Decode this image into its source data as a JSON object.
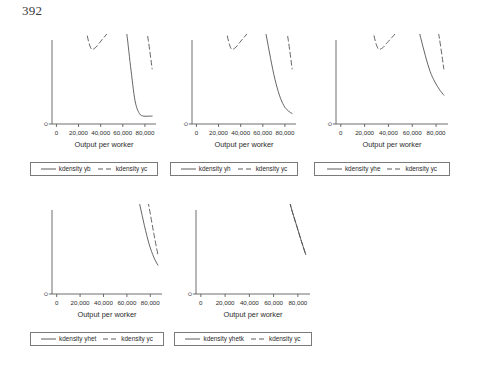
{
  "page": {
    "number": "392"
  },
  "chart_data": [
    {
      "id": "panel-yb",
      "type": "line",
      "title": "",
      "xlabel": "Output per worker",
      "ylabel": "",
      "xlim": [
        -4000,
        90000
      ],
      "ylim": [
        0,
        3.2e-06
      ],
      "xticks": [
        0,
        20000,
        40000,
        60000,
        80000
      ],
      "xticklabels": [
        "0",
        "20,000",
        "40,000",
        "60,000",
        "80,000"
      ],
      "yticks": [
        0,
        1e-05,
        2e-05,
        3e-05
      ],
      "yticklabels": [
        "0",
        ".00001",
        ".00002",
        ".00003"
      ],
      "grid": false,
      "legend_position": "bottom",
      "series": [
        {
          "name": "kdensity yb",
          "style": "solid",
          "x": [
            -1500,
            1500,
            4000,
            6500,
            9000,
            12000,
            15000,
            18000,
            21000,
            24000,
            27000,
            31000,
            35000,
            39000,
            43000,
            47000,
            51000,
            55000,
            59000,
            63000,
            67000,
            71000,
            75000,
            79000,
            83000,
            86500
          ],
          "y": [
            2.72e-05,
            3e-05,
            3.07e-05,
            3e-05,
            2.76e-05,
            2.24e-05,
            1.66e-05,
            1.14e-05,
            7.2e-06,
            5e-06,
            4.5e-06,
            4.7e-06,
            5.2e-06,
            5.6e-06,
            5.5e-06,
            5e-06,
            4.6e-06,
            4.4e-06,
            4.2e-06,
            3.6e-06,
            2.2e-06,
            9e-07,
            4e-07,
            3e-07,
            3e-07,
            3e-07
          ]
        },
        {
          "name": "kdensity yc",
          "style": "dashed",
          "x": [
            -1500,
            1500,
            4000,
            6500,
            9000,
            12000,
            15000,
            18000,
            21000,
            24000,
            27000,
            31000,
            35000,
            39000,
            43000,
            47000,
            51000,
            55000,
            59000,
            63000,
            67000,
            71000,
            75000,
            79000,
            83000,
            86500
          ],
          "y": [
            1.9e-05,
            2.07e-05,
            2.12e-05,
            2.07e-05,
            1.94e-05,
            1.68e-05,
            1.36e-05,
            1.02e-05,
            7.2e-06,
            5e-06,
            3.6e-06,
            2.9e-06,
            2.9e-06,
            3.1e-06,
            3.3e-06,
            3.5e-06,
            3.7e-06,
            3.9e-06,
            4.2e-06,
            4.4e-06,
            4.6e-06,
            4.7e-06,
            4.6e-06,
            4.2e-06,
            3.2e-06,
            2.1e-06
          ]
        }
      ]
    },
    {
      "id": "panel-yh",
      "type": "line",
      "title": "",
      "xlabel": "Output per worker",
      "ylabel": "",
      "xlim": [
        -4000,
        90000
      ],
      "ylim": [
        0,
        3.2e-06
      ],
      "xticks": [
        0,
        20000,
        40000,
        60000,
        80000
      ],
      "xticklabels": [
        "0",
        "20,000",
        "40,000",
        "60,000",
        "80,000"
      ],
      "yticks": [
        0,
        1e-05,
        2e-05,
        3e-05
      ],
      "yticklabels": [
        "0",
        ".00001",
        ".00002",
        ".00003"
      ],
      "grid": false,
      "legend_position": "bottom",
      "series": [
        {
          "name": "kdensity yh",
          "style": "solid",
          "x": [
            -1500,
            1500,
            4000,
            6500,
            9000,
            12000,
            15000,
            18000,
            21000,
            24000,
            27000,
            31000,
            35000,
            39000,
            43000,
            47000,
            51000,
            55000,
            59000,
            63000,
            67000,
            71000,
            75000,
            79000,
            83000,
            86500
          ],
          "y": [
            2.5e-05,
            2.8e-05,
            2.88e-05,
            2.82e-05,
            2.62e-05,
            2.16e-05,
            1.62e-05,
            1.12e-05,
            7.3e-06,
            5.2e-06,
            4.6e-06,
            4.6e-06,
            4.8e-06,
            5e-06,
            5e-06,
            4.9e-06,
            4.8e-06,
            4.6e-06,
            4.2e-06,
            3.4e-06,
            2.5e-06,
            1.7e-06,
            1.1e-06,
            7e-07,
            5e-07,
            4e-07
          ]
        },
        {
          "name": "kdensity yc",
          "style": "dashed",
          "x": [
            -1500,
            1500,
            4000,
            6500,
            9000,
            12000,
            15000,
            18000,
            21000,
            24000,
            27000,
            31000,
            35000,
            39000,
            43000,
            47000,
            51000,
            55000,
            59000,
            63000,
            67000,
            71000,
            75000,
            79000,
            83000,
            86500
          ],
          "y": [
            1.9e-05,
            2.07e-05,
            2.12e-05,
            2.07e-05,
            1.94e-05,
            1.68e-05,
            1.36e-05,
            1.02e-05,
            7.2e-06,
            5e-06,
            3.6e-06,
            2.9e-06,
            2.9e-06,
            3.1e-06,
            3.3e-06,
            3.5e-06,
            3.7e-06,
            3.9e-06,
            4.2e-06,
            4.4e-06,
            4.6e-06,
            4.7e-06,
            4.6e-06,
            4.2e-06,
            3.2e-06,
            2.1e-06
          ]
        }
      ]
    },
    {
      "id": "panel-yhe",
      "type": "line",
      "title": "",
      "xlabel": "Output per worker",
      "ylabel": "",
      "xlim": [
        -4000,
        90000
      ],
      "ylim": [
        0,
        3.2e-06
      ],
      "xticks": [
        0,
        20000,
        40000,
        60000,
        80000
      ],
      "xticklabels": [
        "0",
        "20,000",
        "40,000",
        "60,000",
        "80,000"
      ],
      "yticks": [
        0,
        1e-05,
        2e-05,
        3e-05
      ],
      "yticklabels": [
        "0",
        ".00001",
        ".00002",
        ".00003"
      ],
      "grid": false,
      "legend_position": "bottom",
      "series": [
        {
          "name": "kdensity yhe",
          "style": "solid",
          "x": [
            -1500,
            1500,
            4000,
            6500,
            9000,
            12000,
            15000,
            18000,
            21000,
            24000,
            27000,
            31000,
            35000,
            39000,
            43000,
            47000,
            51000,
            55000,
            59000,
            63000,
            67000,
            71000,
            75000,
            79000,
            83000,
            86500
          ],
          "y": [
            2.62e-05,
            2.94e-05,
            3.02e-05,
            2.96e-05,
            2.74e-05,
            2.26e-05,
            1.68e-05,
            1.14e-05,
            7.4e-06,
            5.2e-06,
            4.7e-06,
            4.8e-06,
            4.9e-06,
            4.8e-06,
            4.5e-06,
            4.3e-06,
            4.3e-06,
            4.4e-06,
            4.4e-06,
            4e-06,
            3.3e-06,
            2.6e-06,
            2e-06,
            1.6e-06,
            1.3e-06,
            1.1e-06
          ]
        },
        {
          "name": "kdensity yc",
          "style": "dashed",
          "x": [
            -1500,
            1500,
            4000,
            6500,
            9000,
            12000,
            15000,
            18000,
            21000,
            24000,
            27000,
            31000,
            35000,
            39000,
            43000,
            47000,
            51000,
            55000,
            59000,
            63000,
            67000,
            71000,
            75000,
            79000,
            83000,
            86500
          ],
          "y": [
            1.9e-05,
            2.07e-05,
            2.12e-05,
            2.07e-05,
            1.94e-05,
            1.68e-05,
            1.36e-05,
            1.02e-05,
            7.2e-06,
            5e-06,
            3.6e-06,
            2.9e-06,
            2.9e-06,
            3.1e-06,
            3.3e-06,
            3.5e-06,
            3.7e-06,
            3.9e-06,
            4.2e-06,
            4.4e-06,
            4.6e-06,
            4.7e-06,
            4.6e-06,
            4.2e-06,
            3.2e-06,
            2.1e-06
          ]
        }
      ]
    },
    {
      "id": "panel-yhet",
      "type": "line",
      "title": "",
      "xlabel": "Output per worker",
      "ylabel": "",
      "xlim": [
        -4000,
        90000
      ],
      "ylim": [
        0,
        3.2e-06
      ],
      "xticks": [
        0,
        20000,
        40000,
        60000,
        80000
      ],
      "xticklabels": [
        "0",
        "20,000",
        "40,000",
        "60,000",
        "80,000"
      ],
      "yticks": [
        0,
        1e-05,
        2e-05,
        3e-05
      ],
      "yticklabels": [
        "0",
        ".00001",
        ".00002",
        ".00003"
      ],
      "grid": false,
      "legend_position": "bottom",
      "series": [
        {
          "name": "kdensity yhet",
          "style": "solid",
          "x": [
            -1500,
            1500,
            4000,
            6500,
            9000,
            12000,
            15000,
            18000,
            21000,
            24000,
            27000,
            31000,
            35000,
            39000,
            43000,
            47000,
            51000,
            55000,
            59000,
            63000,
            67000,
            71000,
            75000,
            79000,
            83000,
            86500
          ],
          "y": [
            2.48e-05,
            2.74e-05,
            2.8e-05,
            2.74e-05,
            2.54e-05,
            2.1e-05,
            1.58e-05,
            1.1e-05,
            7.4e-06,
            5.4e-06,
            4.7e-06,
            4.6e-06,
            4.6e-06,
            4.7e-06,
            4.8e-06,
            4.9e-06,
            5e-06,
            5e-06,
            4.9e-06,
            4.6e-06,
            4.1e-06,
            3.4e-06,
            2.6e-06,
            1.9e-06,
            1.4e-06,
            1.1e-06
          ]
        },
        {
          "name": "kdensity yc",
          "style": "dashed",
          "x": [
            -1500,
            1500,
            4000,
            6500,
            9000,
            12000,
            15000,
            18000,
            21000,
            24000,
            27000,
            31000,
            35000,
            39000,
            43000,
            47000,
            51000,
            55000,
            59000,
            63000,
            67000,
            71000,
            75000,
            79000,
            83000,
            86500
          ],
          "y": [
            2.08e-05,
            2.28e-05,
            2.34e-05,
            2.29e-05,
            2.14e-05,
            1.82e-05,
            1.44e-05,
            1.06e-05,
            7.4e-06,
            5.3e-06,
            4.2e-06,
            3.8e-06,
            3.8e-06,
            3.9e-06,
            4e-06,
            4.1e-06,
            4.3e-06,
            4.6e-06,
            4.9e-06,
            5.1e-06,
            5.1e-06,
            4.8e-06,
            4.2e-06,
            3.3e-06,
            2.3e-06,
            1.5e-06
          ]
        }
      ]
    },
    {
      "id": "panel-yhetk",
      "type": "line",
      "title": "",
      "xlabel": "Output per worker",
      "ylabel": "",
      "xlim": [
        -4000,
        90000
      ],
      "ylim": [
        0,
        3.2e-06
      ],
      "xticks": [
        0,
        20000,
        40000,
        60000,
        80000
      ],
      "xticklabels": [
        "0",
        "20,000",
        "40,000",
        "60,000",
        "80,000"
      ],
      "yticks": [
        0,
        1e-05,
        2e-05,
        3e-05
      ],
      "yticklabels": [
        "0",
        ".00001",
        ".00002",
        ".00003"
      ],
      "grid": false,
      "legend_position": "bottom",
      "series": [
        {
          "name": "kdensity yhetk",
          "style": "solid",
          "x": [
            -1500,
            1500,
            4000,
            6500,
            9000,
            12000,
            15000,
            18000,
            21000,
            24000,
            27000,
            31000,
            35000,
            39000,
            43000,
            47000,
            51000,
            55000,
            59000,
            63000,
            67000,
            71000,
            75000,
            79000,
            83000,
            86500
          ],
          "y": [
            2.18e-05,
            2.28e-05,
            2.31e-05,
            2.28e-05,
            2.19e-05,
            1.98e-05,
            1.66e-05,
            1.26e-05,
            8.6e-06,
            5.8e-06,
            4.4e-06,
            3.9e-06,
            3.9e-06,
            4.1e-06,
            4.5e-06,
            4.9e-06,
            5.2e-06,
            5.3e-06,
            5.3e-06,
            5e-06,
            4.5e-06,
            3.9e-06,
            3.2e-06,
            2.6e-06,
            2e-06,
            1.5e-06
          ]
        },
        {
          "name": "kdensity yc",
          "style": "dashed",
          "x": [
            -1500,
            1500,
            4000,
            6500,
            9000,
            12000,
            15000,
            18000,
            21000,
            24000,
            27000,
            31000,
            35000,
            39000,
            43000,
            47000,
            51000,
            55000,
            59000,
            63000,
            67000,
            71000,
            75000,
            79000,
            83000,
            86500
          ],
          "y": [
            2.18e-05,
            2.28e-05,
            2.31e-05,
            2.28e-05,
            2.19e-05,
            1.98e-05,
            1.66e-05,
            1.26e-05,
            8.6e-06,
            5.8e-06,
            4.4e-06,
            3.9e-06,
            3.9e-06,
            4.1e-06,
            4.5e-06,
            4.9e-06,
            5.2e-06,
            5.3e-06,
            5.3e-06,
            5e-06,
            4.5e-06,
            3.9e-06,
            3.2e-06,
            2.6e-06,
            2e-06,
            1.5e-06
          ]
        }
      ]
    }
  ]
}
